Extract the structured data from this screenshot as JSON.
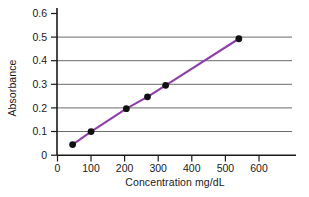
{
  "chart_data": {
    "type": "line",
    "title": "",
    "xlabel": "Concentration mg/dL",
    "ylabel": "Absorbance",
    "xlim": [
      0,
      640
    ],
    "ylim": [
      0,
      0.63
    ],
    "xticks": [
      0,
      100,
      200,
      300,
      400,
      500,
      600
    ],
    "xtick_labels": [
      "0",
      "100",
      "200",
      "300",
      "400",
      "500",
      "600"
    ],
    "yticks": [
      0,
      0.1,
      0.2,
      0.3,
      0.4,
      0.5,
      0.6
    ],
    "ytick_labels": [
      "0",
      "0.1",
      "0.2",
      "0.3",
      "0.4",
      "0.5",
      "0.6"
    ],
    "grid": "horizontal",
    "legend": "none",
    "series": [
      {
        "name": "Standard curve",
        "line_color": "#8f3fa8",
        "marker_color": "#111111",
        "x": [
          45,
          100,
          205,
          268,
          322,
          540
        ],
        "y": [
          0.045,
          0.1,
          0.197,
          0.247,
          0.296,
          0.493
        ],
        "points": [
          {
            "x": 45,
            "y": 0.045
          },
          {
            "x": 100,
            "y": 0.1
          },
          {
            "x": 205,
            "y": 0.197
          },
          {
            "x": 268,
            "y": 0.247
          },
          {
            "x": 322,
            "y": 0.296
          },
          {
            "x": 540,
            "y": 0.493
          }
        ]
      }
    ]
  },
  "axes": {
    "y_axis_name": "absorbance-axis",
    "x_axis_name": "concentration-axis"
  },
  "colors": {
    "line": "#8f3fa8",
    "marker": "#111111",
    "grid": "#6b6b6b",
    "axis": "#1a1a1a",
    "background": "#ffffff"
  }
}
